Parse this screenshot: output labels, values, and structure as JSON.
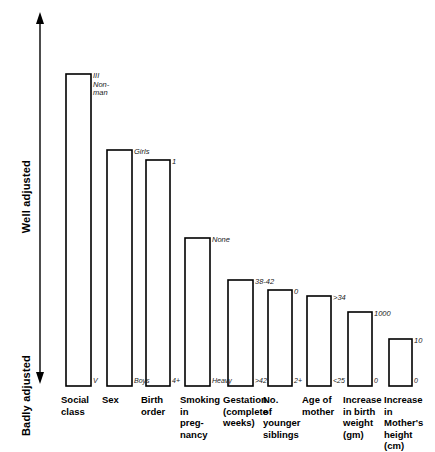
{
  "chart_data": {
    "type": "bar",
    "title": "",
    "subtitle": "",
    "xlabel": "",
    "ylabel": "Adjustment",
    "grid": false,
    "legend": null,
    "axis": {
      "top_label": "Well adjusted",
      "bottom_label": "Badly adjusted",
      "direction": "double-arrow-vertical",
      "ylim": [
        0,
        100
      ],
      "note": "y-axis is an unscaled ordinal arrow from Badly adjusted (bottom) to Well adjusted (top)"
    },
    "categories": [
      "Social class",
      "Sex",
      "Birth order",
      "Smoking in pregnancy",
      "Gestation (complete weeks)",
      "No. of younger siblings",
      "Age of mother",
      "Increase in birth weight (gm)",
      "Increase in Mother's height (cm)"
    ],
    "category_labels_multiline": [
      "Social\nclass",
      "Sex",
      "Birth\norder",
      "Smoking\nin\npreg-\nnancy",
      "Gestation\n(complete\nweeks)",
      "No.\nof\nyounger\nsiblings",
      "Age of\nmother",
      "Increase\nin birth\nweight\n(gm)",
      "Increase\nin\nMother's\nheight\n(cm)"
    ],
    "values": [
      100,
      76,
      73,
      47,
      34,
      31,
      29,
      24,
      15
    ],
    "top_value_labels": [
      "III\nNon-\nman",
      "Girls",
      "1",
      "None",
      "38-42",
      "0",
      ">34",
      "1000",
      "10"
    ],
    "bottom_value_labels": [
      "V",
      "Boys",
      "4+",
      "Heavy",
      ">42",
      "2+",
      "<25",
      "0",
      "0"
    ],
    "bars_px": [
      {
        "x": 66,
        "width": 25,
        "top": 74,
        "bottom": 386
      },
      {
        "x": 107,
        "width": 25,
        "top": 150,
        "bottom": 386
      },
      {
        "x": 146,
        "width": 24,
        "top": 160,
        "bottom": 386
      },
      {
        "x": 185,
        "width": 25,
        "top": 238,
        "bottom": 386
      },
      {
        "x": 228,
        "width": 25,
        "top": 280,
        "bottom": 386
      },
      {
        "x": 268,
        "width": 24,
        "top": 290,
        "bottom": 386
      },
      {
        "x": 307,
        "width": 24,
        "top": 296,
        "bottom": 386
      },
      {
        "x": 348,
        "width": 24,
        "top": 312,
        "bottom": 386
      },
      {
        "x": 389,
        "width": 23,
        "top": 339,
        "bottom": 386
      }
    ],
    "colors": {
      "bar_fill": "#ffffff",
      "bar_stroke": "#000000",
      "text": "#000000",
      "axis": "#000000",
      "background": "#ffffff"
    }
  },
  "axis_labels": {
    "well_adjusted": "Well adjusted",
    "badly_adjusted": "Badly adjusted"
  },
  "bars": [
    {
      "top": "III\nNon-\nman",
      "bottom": "V",
      "cat": "Social\nclass"
    },
    {
      "top": "Girls",
      "bottom": "Boys",
      "cat": "Sex"
    },
    {
      "top": "1",
      "bottom": "4+",
      "cat": "Birth\norder"
    },
    {
      "top": "None",
      "bottom": "Heavy",
      "cat": "Smoking\nin\npreg-\nnancy"
    },
    {
      "top": "38-42",
      "bottom": ">42",
      "cat": "Gestation\n(complete\nweeks)"
    },
    {
      "top": "0",
      "bottom": "2+",
      "cat": "No.\nof\nyounger\nsiblings"
    },
    {
      "top": ">34",
      "bottom": "<25",
      "cat": "Age of\nmother"
    },
    {
      "top": "1000",
      "bottom": "0",
      "cat": "Increase\nin birth\nweight\n(gm)"
    },
    {
      "top": "10",
      "bottom": "0",
      "cat": "Increase\nin\nMother's\nheight\n(cm)"
    }
  ]
}
